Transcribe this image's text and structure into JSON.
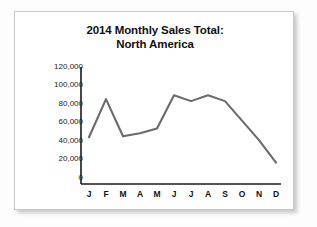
{
  "chart_data": {
    "type": "line",
    "title": "2014 Monthly Sales Total: North America",
    "title_line1": "2014 Monthly Sales Total:",
    "title_line2": "North America",
    "xlabel": "",
    "ylabel": "",
    "categories": [
      "J",
      "F",
      "M",
      "A",
      "M",
      "J",
      "J",
      "A",
      "S",
      "O",
      "N",
      "D"
    ],
    "values": [
      48000,
      87000,
      49000,
      52000,
      57000,
      91000,
      85000,
      91000,
      85000,
      65000,
      45000,
      22000
    ],
    "ylim": [
      0,
      120000
    ],
    "ytick_values": [
      0,
      20000,
      40000,
      60000,
      80000,
      100000,
      120000
    ],
    "ytick_labels": [
      "0",
      "20,000",
      "40,000",
      "60,000",
      "80,000",
      "100,000",
      "120,000"
    ],
    "grid": false,
    "legend": false,
    "series": [
      {
        "name": "Monthly Sales Total",
        "color": "#6b6b6b",
        "values": [
          48000,
          87000,
          49000,
          52000,
          57000,
          91000,
          85000,
          91000,
          85000,
          65000,
          45000,
          22000
        ]
      }
    ]
  },
  "colors": {
    "line": "#6b6b6b",
    "axis": "#1a1a1a",
    "card_background": "#ffffff",
    "card_border": "#c9c9c9",
    "page_background": "#fdfdfd",
    "text": "#111111"
  }
}
